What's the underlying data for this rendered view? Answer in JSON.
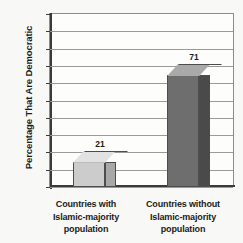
{
  "chart_data": {
    "type": "bar",
    "title": "",
    "subtitle": "",
    "xlabel": "",
    "ylabel": "Percentage That Are Democratic",
    "categories": [
      "Countries with Islamic-majority population",
      "Countries without Islamic-majority population"
    ],
    "category_lines": [
      [
        "Countries with",
        "Islamic-majority",
        "population"
      ],
      [
        "Countries without",
        "Islamic-majority",
        "population"
      ]
    ],
    "values": [
      21,
      71
    ],
    "value_labels": [
      "21",
      "71"
    ],
    "ylim": [
      0,
      100
    ],
    "ytick_step": 10,
    "yticks": [
      "100",
      "90",
      "80",
      "70",
      "60",
      "50",
      "40",
      "30",
      "20",
      "10",
      "0"
    ],
    "ytick_values": [
      100,
      90,
      80,
      70,
      60,
      50,
      40,
      30,
      20,
      10,
      0
    ],
    "grid": true,
    "legend": false,
    "legend_position": "none",
    "style": "3d-column",
    "colors": {
      "bar_light_front": "#cccccc",
      "bar_light_top": "#e2e2e2",
      "bar_light_side": "#a8a8a8",
      "bar_dark_front": "#6e6e6e",
      "bar_dark_top": "#a9a9a9",
      "bar_dark_side": "#4a4a4a",
      "axis": "#3a3a3a",
      "grid": "#9a9a9a",
      "text": "#1b1b1b",
      "plot_background": "#fdfdfc",
      "page_background": "#f8f8f6"
    }
  }
}
